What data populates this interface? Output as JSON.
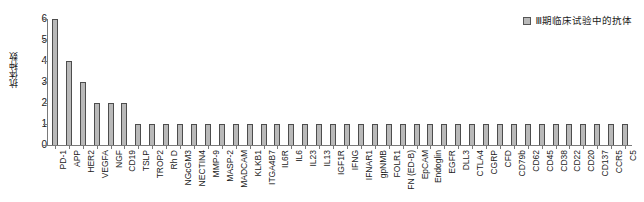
{
  "legend": {
    "entries": [
      {
        "label": "Ⅲ期临床试验中的抗体",
        "color": "#b9b9b9",
        "marker": "square-swatch-icon"
      }
    ],
    "position": "top-right"
  },
  "axes": {
    "ylabel": "抗体种数",
    "xlabel": "",
    "yticks": [
      "0",
      "1",
      "2",
      "3",
      "4",
      "5",
      "6"
    ],
    "ylim": [
      0,
      6
    ],
    "grid": false
  },
  "chart_data": {
    "type": "bar",
    "title": "",
    "subtitle": "",
    "xlabel": "",
    "ylabel": "抗体种数",
    "ylim": [
      0,
      6
    ],
    "yticks": [
      0,
      1,
      2,
      3,
      4,
      5,
      6
    ],
    "grid": false,
    "legend": [
      "Ⅲ期临床试验中的抗体"
    ],
    "legend_position": "top-right",
    "bar_color": "#b9b9b9",
    "bar_edge_color": "#4d4d4d",
    "categories": [
      "PD-1",
      "APP",
      "HER2",
      "VEGFA",
      "NGF",
      "CD19",
      "TSLP",
      "TROP2",
      "Rh D",
      "NGcGM3",
      "NECTIN4",
      "MMP-9",
      "MASP-2",
      "MADCAM",
      "KLKB1",
      "ITGA4B7",
      "IL6R",
      "IL6",
      "IL23",
      "IL13",
      "IGF1R",
      "IFNG",
      "IFNAR1",
      "gpNMB",
      "FOLR1",
      "FN (ED-B)",
      "EpCAM",
      "Endoglin",
      "EGFR",
      "DLL3",
      "CTLA4",
      "CGRP",
      "CFD",
      "CD79b",
      "CD62",
      "CD45",
      "CD38",
      "CD22",
      "CD20",
      "CD137",
      "CCR5",
      "C5"
    ],
    "values": [
      6,
      4,
      3,
      2,
      2,
      2,
      1,
      1,
      1,
      1,
      1,
      1,
      1,
      1,
      1,
      1,
      1,
      1,
      1,
      1,
      1,
      1,
      1,
      1,
      1,
      1,
      1,
      1,
      1,
      1,
      1,
      1,
      1,
      1,
      1,
      1,
      1,
      1,
      1,
      1,
      1,
      1
    ],
    "series": [
      {
        "name": "Ⅲ期临床试验中的抗体",
        "values": [
          6,
          4,
          3,
          2,
          2,
          2,
          1,
          1,
          1,
          1,
          1,
          1,
          1,
          1,
          1,
          1,
          1,
          1,
          1,
          1,
          1,
          1,
          1,
          1,
          1,
          1,
          1,
          1,
          1,
          1,
          1,
          1,
          1,
          1,
          1,
          1,
          1,
          1,
          1,
          1,
          1,
          1
        ]
      }
    ]
  }
}
